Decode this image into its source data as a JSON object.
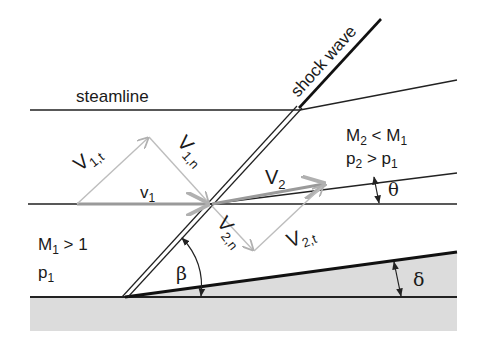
{
  "diagram": {
    "labels": {
      "streamline": "steamline",
      "shock_wave": "shock wave",
      "region2_mach_main": "M",
      "region2_mach_sub": "2",
      "region2_mach_rel": " < M",
      "region2_mach_rel_sub": "1",
      "region2_p_main": "p",
      "region2_p_sub": "2",
      "region2_p_rel": " > p",
      "region2_p_rel_sub": "1",
      "region1_mach_main": "M",
      "region1_mach_sub": "1",
      "region1_mach_rel": " > 1",
      "region1_p_main": "p",
      "region1_p_sub": "1",
      "v1_main": "v",
      "v1_sub": "1",
      "v1t_main": "V",
      "v1t_sub": "1,t",
      "v1n_main": "V",
      "v1n_sub": "1,n",
      "v2_main": "V",
      "v2_sub": "2",
      "v2n_main": "V",
      "v2n_sub": "2,n",
      "v2t_main": "V",
      "v2t_sub": "2,t",
      "beta": "β",
      "theta": "θ",
      "delta": "δ"
    },
    "colors": {
      "line": "#222222",
      "vector": "#b8b8b8",
      "velocity": "#9a9a9a",
      "wall_fill": "#dcdcdc",
      "background": "#ffffff"
    }
  }
}
